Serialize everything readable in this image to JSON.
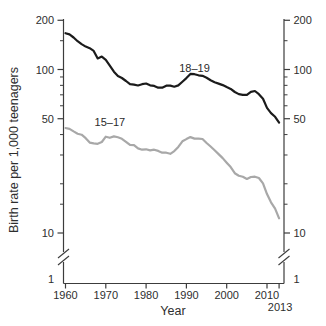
{
  "window": {
    "background": "#ffffff",
    "text_color": "#2e2e2e",
    "axis_color": "#3c3c3c"
  },
  "chart_data": {
    "type": "line",
    "title": "",
    "xlabel": "Year",
    "ylabel": "Birth rate per 1,000 teenagers",
    "y_scale": "log",
    "y_axis": {
      "major_ticks": [
        {
          "value": 200,
          "label": "200"
        },
        {
          "value": 100,
          "label": "100"
        },
        {
          "value": 50,
          "label": "50"
        },
        {
          "value": 10,
          "label": "10"
        }
      ],
      "minor_ticks": [
        150,
        90,
        80,
        70,
        60,
        40,
        30,
        20,
        15
      ],
      "axis_break": true,
      "below_break_label": "1",
      "mirrored_right_axis": true
    },
    "x_axis": {
      "ticks": [
        {
          "year": 1960,
          "label": "1960",
          "row": 1
        },
        {
          "year": 1970,
          "label": "1970",
          "row": 1
        },
        {
          "year": 1980,
          "label": "1980",
          "row": 1
        },
        {
          "year": 1990,
          "label": "1990",
          "row": 1
        },
        {
          "year": 2000,
          "label": "2000",
          "row": 1
        },
        {
          "year": 2010,
          "label": "2010",
          "row": 1
        },
        {
          "year": 2013,
          "label": "2013",
          "row": 2
        }
      ]
    },
    "x": [
      1960,
      1961,
      1962,
      1963,
      1964,
      1965,
      1966,
      1967,
      1968,
      1969,
      1970,
      1971,
      1972,
      1973,
      1974,
      1975,
      1976,
      1977,
      1978,
      1979,
      1980,
      1981,
      1982,
      1983,
      1984,
      1985,
      1986,
      1987,
      1988,
      1989,
      1990,
      1991,
      1992,
      1993,
      1994,
      1995,
      1996,
      1997,
      1998,
      1999,
      2000,
      2001,
      2002,
      2003,
      2004,
      2005,
      2006,
      2007,
      2008,
      2009,
      2010,
      2011,
      2012,
      2013
    ],
    "series": [
      {
        "name": "18–19",
        "color": "#1b1b1b",
        "stroke_width": 2.2,
        "label": {
          "text": "18–19",
          "anchor_year": 1992,
          "anchor_value": 102
        },
        "values": [
          166.7,
          164,
          157,
          149,
          143,
          138,
          135,
          130,
          117,
          120,
          114.7,
          105.6,
          96.9,
          91.2,
          88.7,
          85.0,
          81.3,
          80.9,
          79.8,
          81.3,
          82.1,
          80.0,
          79.4,
          77.4,
          77.4,
          79.6,
          79.7,
          78.5,
          79.9,
          84.2,
          88.6,
          94.0,
          93.6,
          92.1,
          91.5,
          89.1,
          86.0,
          83.6,
          82.0,
          80.3,
          78.1,
          76.1,
          72.8,
          70.7,
          70.0,
          69.9,
          73.0,
          73.9,
          70.6,
          66.2,
          58.2,
          54.1,
          51.4,
          47.3
        ]
      },
      {
        "name": "15–17",
        "color": "#a8a8a8",
        "stroke_width": 2.2,
        "label": {
          "text": "15–17",
          "anchor_year": 1971,
          "anchor_value": 48
        },
        "values": [
          43.9,
          43.3,
          41.8,
          40.5,
          39.9,
          38.0,
          35.7,
          35.3,
          35.1,
          36.0,
          38.8,
          38.2,
          39.0,
          38.5,
          37.7,
          36.1,
          34.6,
          34.5,
          32.9,
          32.3,
          32.5,
          32.0,
          32.3,
          31.8,
          31.0,
          31.0,
          30.5,
          31.7,
          33.6,
          36.4,
          37.5,
          38.6,
          37.8,
          37.8,
          37.6,
          35.5,
          33.8,
          32.1,
          30.4,
          28.7,
          26.9,
          25.3,
          23.2,
          22.4,
          22.1,
          21.4,
          22.0,
          22.1,
          21.7,
          20.1,
          17.3,
          15.4,
          14.1,
          12.3
        ]
      }
    ]
  }
}
